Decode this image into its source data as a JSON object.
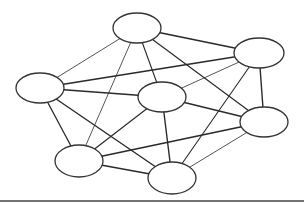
{
  "diagram": {
    "type": "undirected-graph",
    "colors": {
      "background": "#ffffff",
      "edge": "#2a2a2a",
      "node_stroke": "#333333",
      "node_fill": "#ffffff",
      "baseline": "#444444"
    },
    "nodes": [
      {
        "id": "n1",
        "cx": 137,
        "cy": 28,
        "rx": 24,
        "ry": 15
      },
      {
        "id": "n2",
        "cx": 259,
        "cy": 53,
        "rx": 25,
        "ry": 15
      },
      {
        "id": "n3",
        "cx": 40,
        "cy": 88,
        "rx": 24,
        "ry": 15
      },
      {
        "id": "n4",
        "cx": 162,
        "cy": 97,
        "rx": 24,
        "ry": 15
      },
      {
        "id": "n5",
        "cx": 264,
        "cy": 122,
        "rx": 24,
        "ry": 15
      },
      {
        "id": "n6",
        "cx": 79,
        "cy": 161,
        "rx": 24,
        "ry": 16
      },
      {
        "id": "n7",
        "cx": 172,
        "cy": 178,
        "rx": 24,
        "ry": 16
      }
    ],
    "edges": [
      {
        "from": "n1",
        "to": "n2",
        "weight": 1.6
      },
      {
        "from": "n1",
        "to": "n3",
        "weight": 0.8
      },
      {
        "from": "n1",
        "to": "n4",
        "weight": 1.1
      },
      {
        "from": "n1",
        "to": "n6",
        "weight": 0.8
      },
      {
        "from": "n1",
        "to": "n5",
        "weight": 1.2
      },
      {
        "from": "n2",
        "to": "n3",
        "weight": 1.6
      },
      {
        "from": "n2",
        "to": "n4",
        "weight": 0.8
      },
      {
        "from": "n2",
        "to": "n5",
        "weight": 1.4
      },
      {
        "from": "n2",
        "to": "n7",
        "weight": 1.1
      },
      {
        "from": "n3",
        "to": "n4",
        "weight": 1.6
      },
      {
        "from": "n3",
        "to": "n6",
        "weight": 1.3
      },
      {
        "from": "n3",
        "to": "n7",
        "weight": 1.4
      },
      {
        "from": "n4",
        "to": "n5",
        "weight": 1.5
      },
      {
        "from": "n4",
        "to": "n6",
        "weight": 1.2
      },
      {
        "from": "n4",
        "to": "n7",
        "weight": 1.4
      },
      {
        "from": "n5",
        "to": "n6",
        "weight": 1.6
      },
      {
        "from": "n5",
        "to": "n7",
        "weight": 0.8
      },
      {
        "from": "n6",
        "to": "n7",
        "weight": 1.5
      }
    ],
    "baseline": {
      "x1": 0,
      "x2": 304,
      "y": 201
    }
  }
}
